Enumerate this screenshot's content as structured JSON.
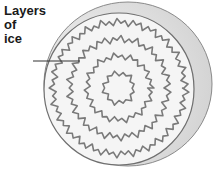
{
  "diagram": {
    "labels": [
      {
        "id": "layers-of-ice",
        "lines": [
          "Layers",
          "of",
          "ice"
        ],
        "points_to": "concentric ice layers"
      }
    ],
    "ring_count": 4,
    "colors": {
      "label_text": "#1a1a1a",
      "leader_line": "#333333",
      "ice_fill": "#f4f4f4",
      "ring_stroke": "#777777",
      "edge_shade": "#d6d6d6"
    }
  }
}
